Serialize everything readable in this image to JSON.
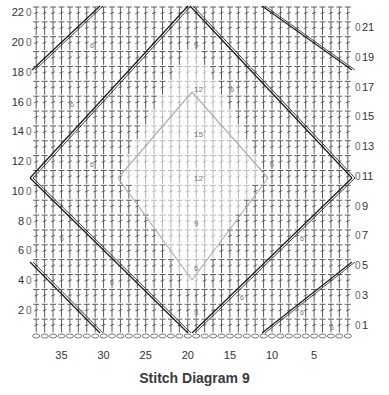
{
  "title": "Stitch Diagram 9",
  "chart_data": {
    "type": "crochet-stitch-chart",
    "title": "Stitch Diagram 9",
    "stitch_count": 38,
    "row_count": 22,
    "row_labels_left": [
      "22",
      "20",
      "18",
      "16",
      "14",
      "12",
      "10",
      "8",
      "6",
      "4",
      "2"
    ],
    "row_labels_right": [
      "21",
      "19",
      "17",
      "15",
      "13",
      "11",
      "9",
      "7",
      "5",
      "3",
      "1"
    ],
    "row_turn_marker": "0",
    "column_labels": [
      "35",
      "30",
      "25",
      "20",
      "15",
      "10",
      "5"
    ],
    "center_column_counts": [
      "3",
      "6",
      "9",
      "12",
      "15",
      "12",
      "9",
      "6",
      "3"
    ],
    "repeat_count_labels": [
      "1",
      "2",
      "3",
      "4",
      "5",
      "6",
      "7",
      "8"
    ],
    "stitch_symbols": [
      "chain (oval)",
      "double crochet (T with bar)",
      "dc2tog / cluster (V / A)"
    ],
    "motif": "nested diamonds: outer dark diamond lines, inner gray diamond",
    "colors": {
      "stitch": "#4a4a4a",
      "diamond_outer": "#1a1a1a",
      "diamond_inner": "#b0b0b0",
      "count_text": "#777777"
    }
  }
}
